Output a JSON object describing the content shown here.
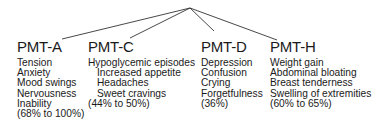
{
  "diagram": {
    "root_point": {
      "x": 190,
      "y": 8
    },
    "line_color": "#333333",
    "groups": [
      {
        "id": "pmt-a",
        "title": "PMT-A",
        "x": 17,
        "connector_end": {
          "x": 62,
          "y": 39
        },
        "symptoms": [
          "Tension",
          "Anxiety",
          "Mood swings",
          "Nervousness",
          "Inability"
        ],
        "prevalence": "(68% to 100%)"
      },
      {
        "id": "pmt-c",
        "title": "PMT-C",
        "x": 88,
        "connector_end": {
          "x": 130,
          "y": 38
        },
        "symptoms": [
          "Hypoglycemic episodes"
        ],
        "sub_symptoms": [
          "Increased appetite",
          "Headaches",
          "Sweet cravings"
        ],
        "prevalence": "(44% to 50%)"
      },
      {
        "id": "pmt-d",
        "title": "PMT-D",
        "x": 201,
        "connector_end": {
          "x": 214,
          "y": 31
        },
        "symptoms": [
          "Depression",
          "Confusion",
          "Crying",
          "Forgetfulness"
        ],
        "prevalence": "(36%)"
      },
      {
        "id": "pmt-h",
        "title": "PMT-H",
        "x": 270,
        "connector_end": {
          "x": 277,
          "y": 40
        },
        "symptoms": [
          "Weight gain",
          "Abdominal bloating",
          "Breast tenderness",
          "Swelling of extremities"
        ],
        "prevalence": "(60% to 65%)"
      }
    ]
  }
}
